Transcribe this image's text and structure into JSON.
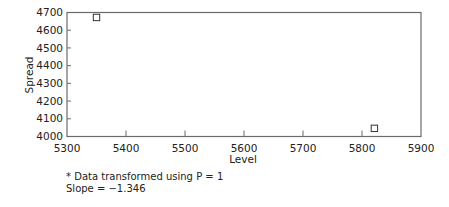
{
  "chart_data": {
    "type": "scatter",
    "title": "",
    "xlabel": "Level",
    "ylabel": "Spread",
    "xlim": [
      5300,
      5900
    ],
    "ylim": [
      4000,
      4700
    ],
    "x_ticks": [
      5300,
      5400,
      5500,
      5600,
      5700,
      5800,
      5900
    ],
    "y_ticks": [
      4000,
      4100,
      4200,
      4300,
      4400,
      4500,
      4600,
      4700
    ],
    "grid": false,
    "legend": null,
    "marker": "open-square",
    "series": [
      {
        "name": "Spread vs Level",
        "points": [
          {
            "x": 5350,
            "y": 4672
          },
          {
            "x": 5821,
            "y": 4046
          }
        ]
      }
    ],
    "annotations": [
      "* Data transformed using P = 1",
      "Slope = −1.346"
    ]
  },
  "footnotes": {
    "transform_note": "* Data transformed using P = 1",
    "slope_note": "Slope = −1.346"
  },
  "colors": {
    "axis": "#6b6b6b",
    "marker_stroke": "#333333",
    "text": "#222222"
  }
}
